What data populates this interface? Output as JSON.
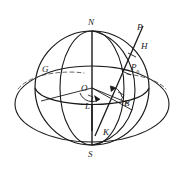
{
  "figure": {
    "kind": "geometry-diagram",
    "width": 184,
    "height": 170,
    "background_color": "#ffffff",
    "stroke_color": "#1a1a1a",
    "labels": {
      "north_pole": "N",
      "south_pole": "S",
      "center": "O",
      "longitude_angle": "L",
      "latitude_angle": "B",
      "point_k": "K",
      "point_g": "G",
      "point_p": "P",
      "point_h": "H",
      "point_p0_base": "P",
      "point_p0_sub": "0"
    }
  }
}
